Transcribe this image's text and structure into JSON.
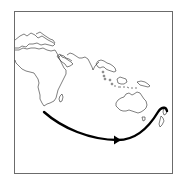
{
  "map": {
    "type": "route-illustration",
    "regions": [
      "Africa",
      "Arabian Peninsula",
      "India",
      "Southeast Asia",
      "Indonesia",
      "Australia",
      "Tasmania",
      "New Zealand",
      "Madagascar"
    ],
    "route": {
      "from": "Southern Africa",
      "to": "New Zealand",
      "direction": "east",
      "color": "#000000"
    },
    "frame_color": "#6b6b6b",
    "line_color": "#2a2a2a",
    "background": "#ffffff"
  }
}
